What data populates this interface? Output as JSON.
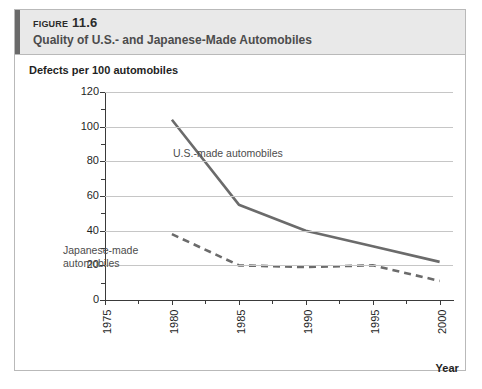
{
  "figure": {
    "number_label": "Figure 11.6",
    "title": "Quality of U.S.- and Japanese-Made Automobiles"
  },
  "chart_data": {
    "type": "line",
    "title": "Quality of U.S.- and Japanese-Made Automobiles",
    "xlabel": "Year",
    "ylabel": "Defects per 100 automobiles",
    "xlim": [
      1975,
      2001
    ],
    "ylim": [
      0,
      120
    ],
    "grid": true,
    "legend": "inline-annotations",
    "x_tick_labels": [
      "1975",
      "1980",
      "1985",
      "1990",
      "1995",
      "2000"
    ],
    "x_ticks": [
      1975,
      1980,
      1985,
      1990,
      1995,
      2000
    ],
    "x_minor_ticks": [
      1977.5,
      1982.5,
      1987.5,
      1992.5,
      1997.5
    ],
    "y_tick_labels": [
      "0",
      "20",
      "40",
      "60",
      "80",
      "100",
      "120"
    ],
    "y_ticks": [
      0,
      20,
      40,
      60,
      80,
      100,
      120
    ],
    "y_minor_ticks": [
      10,
      30,
      50,
      70,
      90,
      110
    ],
    "series": [
      {
        "name": "U.S.-made automobiles",
        "style": "solid",
        "color": "#6b6b6b",
        "x": [
          1980,
          1985,
          1990,
          1995,
          2000
        ],
        "values": [
          104,
          55,
          40,
          31,
          22
        ]
      },
      {
        "name": "Japanese-made automobiles",
        "style": "dashed",
        "color": "#6b6b6b",
        "x": [
          1980,
          1985,
          1990,
          1995,
          2000
        ],
        "values": [
          38,
          20,
          19,
          20,
          11
        ]
      }
    ],
    "annotations": [
      {
        "text": "U.S.-made automobiles",
        "for_series": "U.S.-made automobiles"
      },
      {
        "text": "Japanese-made\nautomobiles",
        "for_series": "Japanese-made automobiles"
      }
    ]
  },
  "colors": {
    "series_line": "#6b6b6b",
    "gridline": "#c6c6c6",
    "axis": "#3a3a3a",
    "header_background": "#e9e9e9",
    "header_accent": "#6a6a6a",
    "card_border": "#b9b9b9"
  }
}
